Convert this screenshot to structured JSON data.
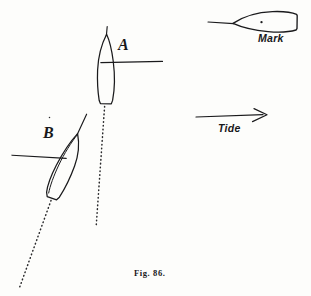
{
  "figure": {
    "caption": "Fig. 86.",
    "ink_color": "#1a1a1c",
    "paper_color": "#fdfdfb",
    "labels": {
      "boat_a": "A",
      "boat_b": "B",
      "mark": "Mark",
      "tide": "Tide"
    },
    "elements": {
      "boat_a_name": "sailboat-a",
      "boat_b_name": "sailboat-b",
      "mark_name": "mark-buoy",
      "tide_arrow_name": "tide-arrow",
      "wake_a_name": "dotted-track-a",
      "wake_b_name": "dotted-track-b"
    }
  }
}
